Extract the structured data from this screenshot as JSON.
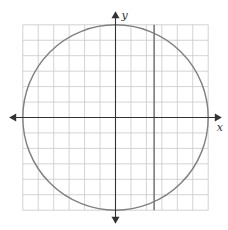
{
  "figure": {
    "type": "coordinate-graph",
    "x_axis_label": "x",
    "y_axis_label": "y",
    "grid_range": {
      "x": [
        -6,
        6
      ],
      "y": [
        -6,
        6
      ]
    },
    "grid_step": 1,
    "tick_labels_shown": false,
    "curves": [
      {
        "name": "circle",
        "equation": "x^2 + y^2 = 36",
        "center": [
          0,
          0
        ],
        "radius": 6,
        "color": "#808080"
      },
      {
        "name": "vertical-line",
        "equation": "x = 2.5",
        "x": 2.5,
        "color": "#7a7a7a"
      }
    ],
    "colors": {
      "grid": "#c8c8c8",
      "axis": "#333333"
    }
  }
}
